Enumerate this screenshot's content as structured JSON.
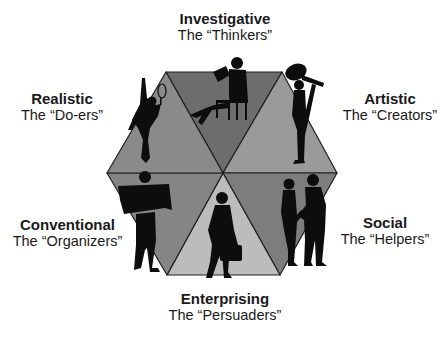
{
  "diagram": {
    "type": "RIASEC hexagon",
    "colors": {
      "top": "#6d6d6d",
      "top_right": "#9a9a9a",
      "bottom_right": "#7d7d7d",
      "bottom": "#bcbcbc",
      "bottom_left": "#858585",
      "top_left": "#8a8a8a",
      "edge": "#1e1e1e",
      "silhouette": "#0d0d0d"
    },
    "types": [
      {
        "key": "investigative",
        "title": "Investigative",
        "subtitle": "The “Thinkers”",
        "figure": "seated-reader"
      },
      {
        "key": "artistic",
        "title": "Artistic",
        "subtitle": "The “Creators”",
        "figure": "guitarist"
      },
      {
        "key": "social",
        "title": "Social",
        "subtitle": "The “Helpers”",
        "figure": "handshake-pair"
      },
      {
        "key": "enterprising",
        "title": "Enterprising",
        "subtitle": "The “Persuaders”",
        "figure": "businesswoman-briefcase"
      },
      {
        "key": "conventional",
        "title": "Conventional",
        "subtitle": "The “Organizers”",
        "figure": "person-reading-newspaper"
      },
      {
        "key": "realistic",
        "title": "Realistic",
        "subtitle": "The “Do-ers”",
        "figure": "tennis-player"
      }
    ]
  }
}
